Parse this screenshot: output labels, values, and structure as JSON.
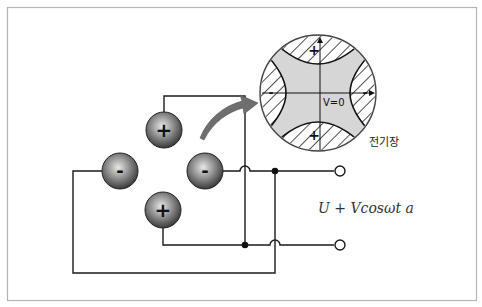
{
  "figure": {
    "frame_color": "#b5b5b5",
    "wire_color": "#1a1a1a",
    "electrodes": [
      {
        "id": "top",
        "sign": "+",
        "cx": 164,
        "cy": 130
      },
      {
        "id": "left",
        "sign": "-",
        "cx": 120,
        "cy": 171
      },
      {
        "id": "right",
        "sign": "-",
        "cx": 205,
        "cy": 171
      },
      {
        "id": "bottom",
        "sign": "+",
        "cx": 163,
        "cy": 210
      }
    ],
    "inset": {
      "label_potential": "V=0",
      "plus_top": "+",
      "plus_bottom": "+",
      "minus_left": "-",
      "minus_right": "-",
      "fill": "#d6d6d6"
    },
    "labels": {
      "field_label": "전기장",
      "voltage_formula": "U + Vcosωt a"
    },
    "arrow_color": "#6e6e6e"
  }
}
